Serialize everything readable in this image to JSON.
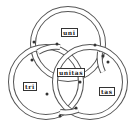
{
  "diagram": {
    "labels": {
      "top": "uni",
      "left": "tri",
      "right": "tas",
      "center": "unitas"
    },
    "rings": [
      {
        "name": "top",
        "cx": 68,
        "cy": 44,
        "r": 35
      },
      {
        "name": "left",
        "cx": 46,
        "cy": 82,
        "r": 35
      },
      {
        "name": "right",
        "cx": 90,
        "cy": 82,
        "r": 35
      }
    ],
    "colors": {
      "stroke": "#555555",
      "band": "#ffffff",
      "background": "#ffffff"
    }
  }
}
